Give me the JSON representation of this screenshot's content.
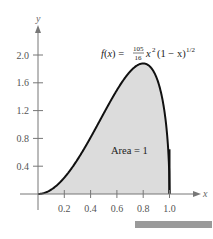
{
  "chart_data": {
    "type": "area",
    "title": "",
    "function_label": "f(x) = (105/16) x^2 (1 - x)^(1/2)",
    "formula": {
      "lhs": "f(x) =",
      "num": "105",
      "den": "16",
      "term1": "x",
      "exp1": "2",
      "term2": "(1 − x)",
      "exp2": "1/2"
    },
    "annotation": "Area = 1",
    "xlabel": "x",
    "ylabel": "y",
    "xlim": [
      0,
      1.1
    ],
    "ylim": [
      0,
      2.2
    ],
    "xticks": [
      0.2,
      0.4,
      0.6,
      0.8,
      1.0
    ],
    "xtick_labels": [
      "0.2",
      "0.4",
      "0.6",
      "0.8",
      "1.0"
    ],
    "yticks": [
      0.4,
      0.8,
      1.2,
      1.6,
      2.0
    ],
    "ytick_labels": [
      "0.4",
      "0.8",
      "1.2",
      "1.6",
      "2.0"
    ],
    "grid": false,
    "legend": null,
    "shaded_region": {
      "from": 0,
      "to": 1,
      "area": 1
    },
    "x": [
      0,
      0.1,
      0.2,
      0.3,
      0.4,
      0.5,
      0.6,
      0.7,
      0.8,
      0.9,
      0.95,
      1.0
    ],
    "values": [
      0,
      0.062,
      0.235,
      0.494,
      0.813,
      1.16,
      1.494,
      1.761,
      1.878,
      1.681,
      1.32,
      0
    ]
  }
}
